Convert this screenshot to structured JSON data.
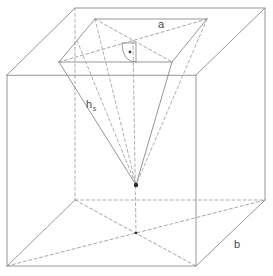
{
  "figure": {
    "stroke_color": "#8a8a8a",
    "hidden_stroke_color": "#9a9a9a",
    "accent_color": "#2b2b2b",
    "background": "#ffffff"
  },
  "labels": {
    "edge_a": {
      "text": "a",
      "subscript": "",
      "x": 158,
      "y": 28,
      "meaning": "base-edge-length-top"
    },
    "slant_height": {
      "text": "h",
      "subscript": "s",
      "x": 86,
      "y": 108,
      "meaning": "slant-height-of-pyramid"
    },
    "edge_b": {
      "text": "b",
      "subscript": "",
      "x": 234,
      "y": 248,
      "meaning": "base-edge-length-bottom"
    }
  },
  "markers": {
    "right_angle": {
      "name": "right-angle-with-dot",
      "center_x": 136,
      "center_y": 57,
      "radius": 14,
      "dot_radius": 1.4
    },
    "apex": {
      "name": "pyramid-apex-point",
      "x": 136,
      "y": 185,
      "radius": 2.2
    }
  },
  "geometry": {
    "cube": {
      "front_top_left": [
        7,
        75
      ],
      "front_top_right": [
        196,
        75
      ],
      "front_bottom_right": [
        196,
        266
      ],
      "front_bottom_left": [
        7,
        266
      ],
      "back_top_left": [
        75,
        8
      ],
      "back_top_right": [
        265,
        8
      ],
      "back_bottom_right": [
        265,
        200
      ],
      "back_bottom_left": [
        75,
        200
      ]
    },
    "pyramid_base": {
      "front_left": [
        59,
        62
      ],
      "front_right": [
        172,
        62
      ],
      "back_right": [
        207,
        19
      ],
      "back_left": [
        95,
        19
      ]
    },
    "apex": [
      136,
      185
    ],
    "cube_bottom_center": [
      136,
      233
    ]
  },
  "view": {
    "width": 273,
    "height": 276
  }
}
